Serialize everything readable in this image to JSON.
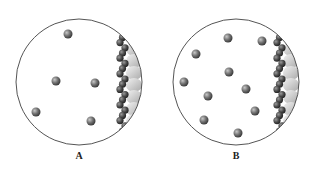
{
  "figure": {
    "panels": [
      {
        "label": "A",
        "circle": {
          "cx": 79,
          "cy": 82,
          "r": 63
        },
        "label_pos": {
          "x": 79,
          "y": 150
        },
        "gas_particles": [
          {
            "x": 68,
            "y": 34
          },
          {
            "x": 56,
            "y": 81
          },
          {
            "x": 95,
            "y": 83
          },
          {
            "x": 36,
            "y": 112
          },
          {
            "x": 91,
            "y": 121
          }
        ],
        "gas_particle_count": 5
      },
      {
        "label": "B",
        "label_pos": {
          "x": 236,
          "y": 150
        },
        "circle": {
          "cx": 236,
          "cy": 82,
          "r": 63
        },
        "gas_particles": [
          {
            "x": 228,
            "y": 38
          },
          {
            "x": 196,
            "y": 54
          },
          {
            "x": 262,
            "y": 41
          },
          {
            "x": 184,
            "y": 82
          },
          {
            "x": 229,
            "y": 72
          },
          {
            "x": 246,
            "y": 89
          },
          {
            "x": 208,
            "y": 96
          },
          {
            "x": 255,
            "y": 111
          },
          {
            "x": 204,
            "y": 120
          },
          {
            "x": 238,
            "y": 133
          }
        ],
        "gas_particle_count": 10
      }
    ],
    "colors": {
      "circle_stroke": "#555555",
      "particle": "#6e6e6e",
      "particle_highlight": "#c8c8c8",
      "surface_dark": "#4a4a4a",
      "surface_light": "#d9d9d9"
    }
  }
}
